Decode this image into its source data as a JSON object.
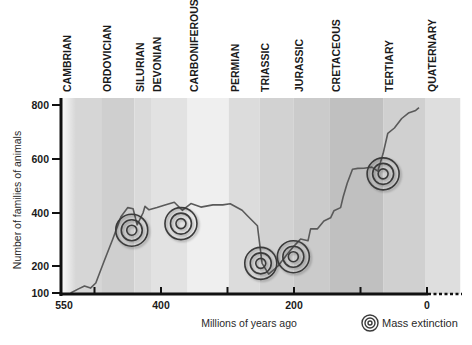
{
  "chart_data": {
    "type": "line",
    "title": "",
    "xlabel": "Millions of years ago",
    "ylabel": "Number of families of animals",
    "xlim": [
      550,
      -50
    ],
    "ylim": [
      100,
      800
    ],
    "x_ticks": [
      550,
      400,
      200,
      0
    ],
    "x_minor_ticks": [
      500,
      300,
      100
    ],
    "y_ticks": [
      800,
      600,
      400,
      200,
      100
    ],
    "grid": false,
    "periods": [
      {
        "name": "CAMBRIAN",
        "start": 550,
        "end": 490,
        "shade": "#d6d6d6"
      },
      {
        "name": "ORDOVICIAN",
        "start": 490,
        "end": 440,
        "shade": "#cfcfcf"
      },
      {
        "name": "SILURIAN",
        "start": 440,
        "end": 415,
        "shade": "#dadada"
      },
      {
        "name": "DEVONIAN",
        "start": 415,
        "end": 360,
        "shade": "#e2e2e2"
      },
      {
        "name": "CARBONIFEROUS",
        "start": 360,
        "end": 298,
        "shade": "#efefef"
      },
      {
        "name": "PERMIAN",
        "start": 298,
        "end": 252,
        "shade": "#dcdcdc"
      },
      {
        "name": "TRIASSIC",
        "start": 252,
        "end": 201,
        "shade": "#d2d2d2"
      },
      {
        "name": "JURASSIC",
        "start": 201,
        "end": 146,
        "shade": "#cbcbcb"
      },
      {
        "name": "CRETACEOUS",
        "start": 146,
        "end": 66,
        "shade": "#c0c0c0"
      },
      {
        "name": "TERTIARY",
        "start": 66,
        "end": 2,
        "shade": "#d0d0d0"
      },
      {
        "name": "QUATERNARY",
        "start": 2,
        "end": -50,
        "shade": "#dedede"
      }
    ],
    "series": [
      {
        "name": "Number of families of animals",
        "x": [
          536,
          524,
          515,
          506,
          498,
          486,
          472,
          460,
          450,
          442,
          436,
          427,
          424,
          418,
          406,
          394,
          380,
          368,
          355,
          340,
          322,
          307,
          296,
          278,
          270,
          255,
          248,
          238,
          224,
          210,
          200,
          190,
          179,
          175,
          165,
          155,
          145,
          140,
          130,
          126,
          120,
          112,
          104,
          95,
          83,
          74,
          66,
          59,
          49,
          38,
          28,
          17,
          12
        ],
        "y": [
          100,
          115,
          126,
          118,
          137,
          215,
          305,
          387,
          420,
          416,
          355,
          400,
          425,
          412,
          420,
          430,
          440,
          410,
          435,
          422,
          430,
          430,
          434,
          410,
          390,
          352,
          210,
          170,
          200,
          245,
          275,
          302,
          295,
          340,
          340,
          370,
          382,
          408,
          420,
          460,
          510,
          562,
          565,
          566,
          570,
          555,
          620,
          695,
          715,
          750,
          770,
          780,
          790
        ]
      }
    ],
    "mass_extinctions": [
      {
        "mya": 444,
        "families": 335
      },
      {
        "mya": 370,
        "families": 360
      },
      {
        "mya": 250,
        "families": 210
      },
      {
        "mya": 201,
        "families": 235
      },
      {
        "mya": 66,
        "families": 545
      }
    ],
    "legend": {
      "position": "bottom-right",
      "entries": [
        "Mass extinction"
      ]
    }
  },
  "labels": {
    "x_axis_title": "Millions of years ago",
    "y_axis_title": "Number of families of animals",
    "legend_text": "Mass extinction",
    "x_tick_labels": [
      "550",
      "400",
      "200",
      "0"
    ],
    "y_tick_labels": [
      "800",
      "600",
      "400",
      "200",
      "100"
    ],
    "periods": [
      "CAMBRIAN",
      "ORDOVICIAN",
      "SILURIAN",
      "DEVONIAN",
      "CARBONIFEROUS",
      "PERMIAN",
      "TRIASSIC",
      "JURASSIC",
      "CRETACEOUS",
      "TERTIARY",
      "QUATERNARY"
    ]
  },
  "colors": {
    "line": "#5a5a5a",
    "axis": "#111111",
    "target_ring": "#3a3a3a"
  }
}
